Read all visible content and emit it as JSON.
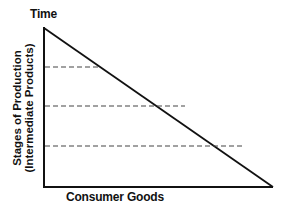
{
  "diagram": {
    "type": "hayekian-triangle",
    "top_label": "Time",
    "x_axis_label": "Consumer Goods",
    "y_axis_label_line1": "Stages of Production",
    "y_axis_label_line2": "(Intermediate Products)",
    "dashed_levels": 3,
    "colors": {
      "line": "#111111",
      "dash": "#444444",
      "background": "#ffffff"
    }
  }
}
